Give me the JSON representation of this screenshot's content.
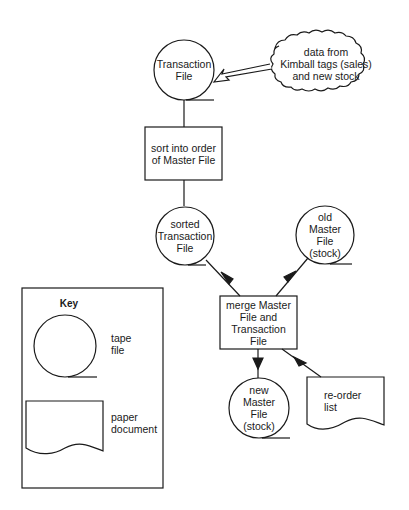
{
  "diagram": {
    "type": "system-flowchart",
    "nodes": {
      "transaction_file": {
        "label": "Transaction\nFile",
        "shape": "tape-file"
      },
      "data_source": {
        "label": "data from\nKimball tags (sales)\nand new stock",
        "shape": "cloud"
      },
      "sort_process": {
        "label": "sort into order\nof Master File",
        "shape": "process-box"
      },
      "sorted_transaction_file": {
        "label": "sorted\nTransaction\nFile",
        "shape": "tape-file"
      },
      "old_master_file": {
        "label": "old\nMaster\nFile\n(stock)",
        "shape": "tape-file"
      },
      "merge_process": {
        "label": "merge Master\nFile and\nTransaction\nFile",
        "shape": "process-box"
      },
      "new_master_file": {
        "label": "new\nMaster\nFile\n(stock)",
        "shape": "tape-file"
      },
      "reorder_list": {
        "label": "re-order\nlist",
        "shape": "paper-document"
      }
    },
    "edges": [
      {
        "from": "data_source",
        "to": "transaction_file",
        "style": "hollow-arrow"
      },
      {
        "from": "transaction_file",
        "to": "sort_process",
        "style": "line"
      },
      {
        "from": "sort_process",
        "to": "sorted_transaction_file",
        "style": "line"
      },
      {
        "from": "sorted_transaction_file",
        "to": "merge_process",
        "style": "arrow"
      },
      {
        "from": "old_master_file",
        "to": "merge_process",
        "style": "arrow"
      },
      {
        "from": "merge_process",
        "to": "new_master_file",
        "style": "arrow"
      },
      {
        "from": "merge_process",
        "to": "reorder_list",
        "style": "arrow"
      }
    ]
  },
  "key": {
    "title": "Key",
    "items": [
      {
        "symbol": "tape-file-icon",
        "label": "tape\nfile"
      },
      {
        "symbol": "paper-document-icon",
        "label": "paper\ndocument"
      }
    ]
  },
  "colors": {
    "ink": "#1a1a1a",
    "background": "#ffffff"
  }
}
